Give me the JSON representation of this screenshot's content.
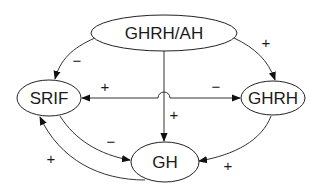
{
  "diagram": {
    "nodes": [
      {
        "id": "ghrh_ah",
        "label": "GHRH/AH"
      },
      {
        "id": "srif",
        "label": "SRIF"
      },
      {
        "id": "ghrh",
        "label": "GHRH"
      },
      {
        "id": "gh",
        "label": "GH"
      }
    ],
    "edges": [
      {
        "from": "GHRH/AH",
        "to": "SRIF",
        "sign": "−"
      },
      {
        "from": "GHRH/AH",
        "to": "GHRH",
        "sign": "+"
      },
      {
        "from": "GHRH/AH",
        "to": "GH",
        "sign": "+"
      },
      {
        "from": "GH",
        "to": "SRIF",
        "sign": "+",
        "label_position": "left-lower"
      },
      {
        "from": "GHRH",
        "to": "SRIF",
        "sign": "+",
        "label_position": "upper-left"
      },
      {
        "from": "SRIF",
        "to": "GHRH",
        "sign": "−",
        "label_position": "upper-right"
      },
      {
        "from": "SRIF",
        "to": "GH",
        "sign": "−"
      },
      {
        "from": "GHRH",
        "to": "GH",
        "sign": "+"
      }
    ],
    "signs": {
      "ah_srif": "−",
      "ah_ghrh": "+",
      "ah_gh": "+",
      "to_srif": "+",
      "to_ghrh": "−",
      "srif_gh": "−",
      "gh_srif": "+",
      "ghrh_gh": "+"
    }
  }
}
